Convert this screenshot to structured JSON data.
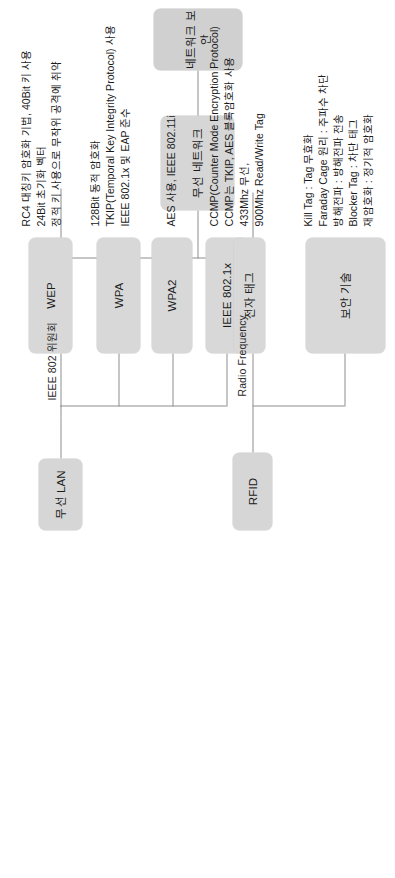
{
  "diagram": {
    "title": "네트워크 보안",
    "root": {
      "label": "네트워크 보안"
    },
    "level1": {
      "label": "무선 네트워크"
    },
    "level2": [
      {
        "label": "무선 LAN",
        "edge_label": "IEEE 802 위원회"
      },
      {
        "label": "RFID",
        "edge_label": "Radio Frequency"
      }
    ],
    "wlan_children": [
      {
        "label": "WEP",
        "desc": "RC4 대칭키 암호화 기법, 40Bit 키 사용\n24Bit 초기화 벡터\n정적 키 사용으로 무작위 공격에 취약"
      },
      {
        "label": "WPA",
        "desc": "128Bit 동적 암호화\nTKIP(Temporal Key Integrity Protocol) 사용\nIEEE 802.1x 및 EAP 준수"
      },
      {
        "label": "WPA2",
        "desc": "AES 사용, IEEE 802.11i"
      },
      {
        "label": "IEEE 802.1x",
        "desc": "CCMP(Counter Mode Encryption Protocol)\nCCMP는 TKIP, AES 블록암호화 사용"
      }
    ],
    "rfid_children": [
      {
        "label": "전자 태그",
        "desc": "433Mhz 무선,\n900Mhz Read/Write Tag"
      },
      {
        "label": "보안 기술",
        "desc": "Kill Tag : Tag 무효화\nFaraday Cage 원리 : 주파수 차단\n방해전파 : 방해전파 전송\nBlocker Tag : 차단 태그\n재암호화 : 정기적 암호화"
      }
    ],
    "colors": {
      "node_fill": "#d4d4d4",
      "line": "#8d8d8d",
      "text": "#1b1b1b",
      "background": "#ffffff"
    }
  }
}
